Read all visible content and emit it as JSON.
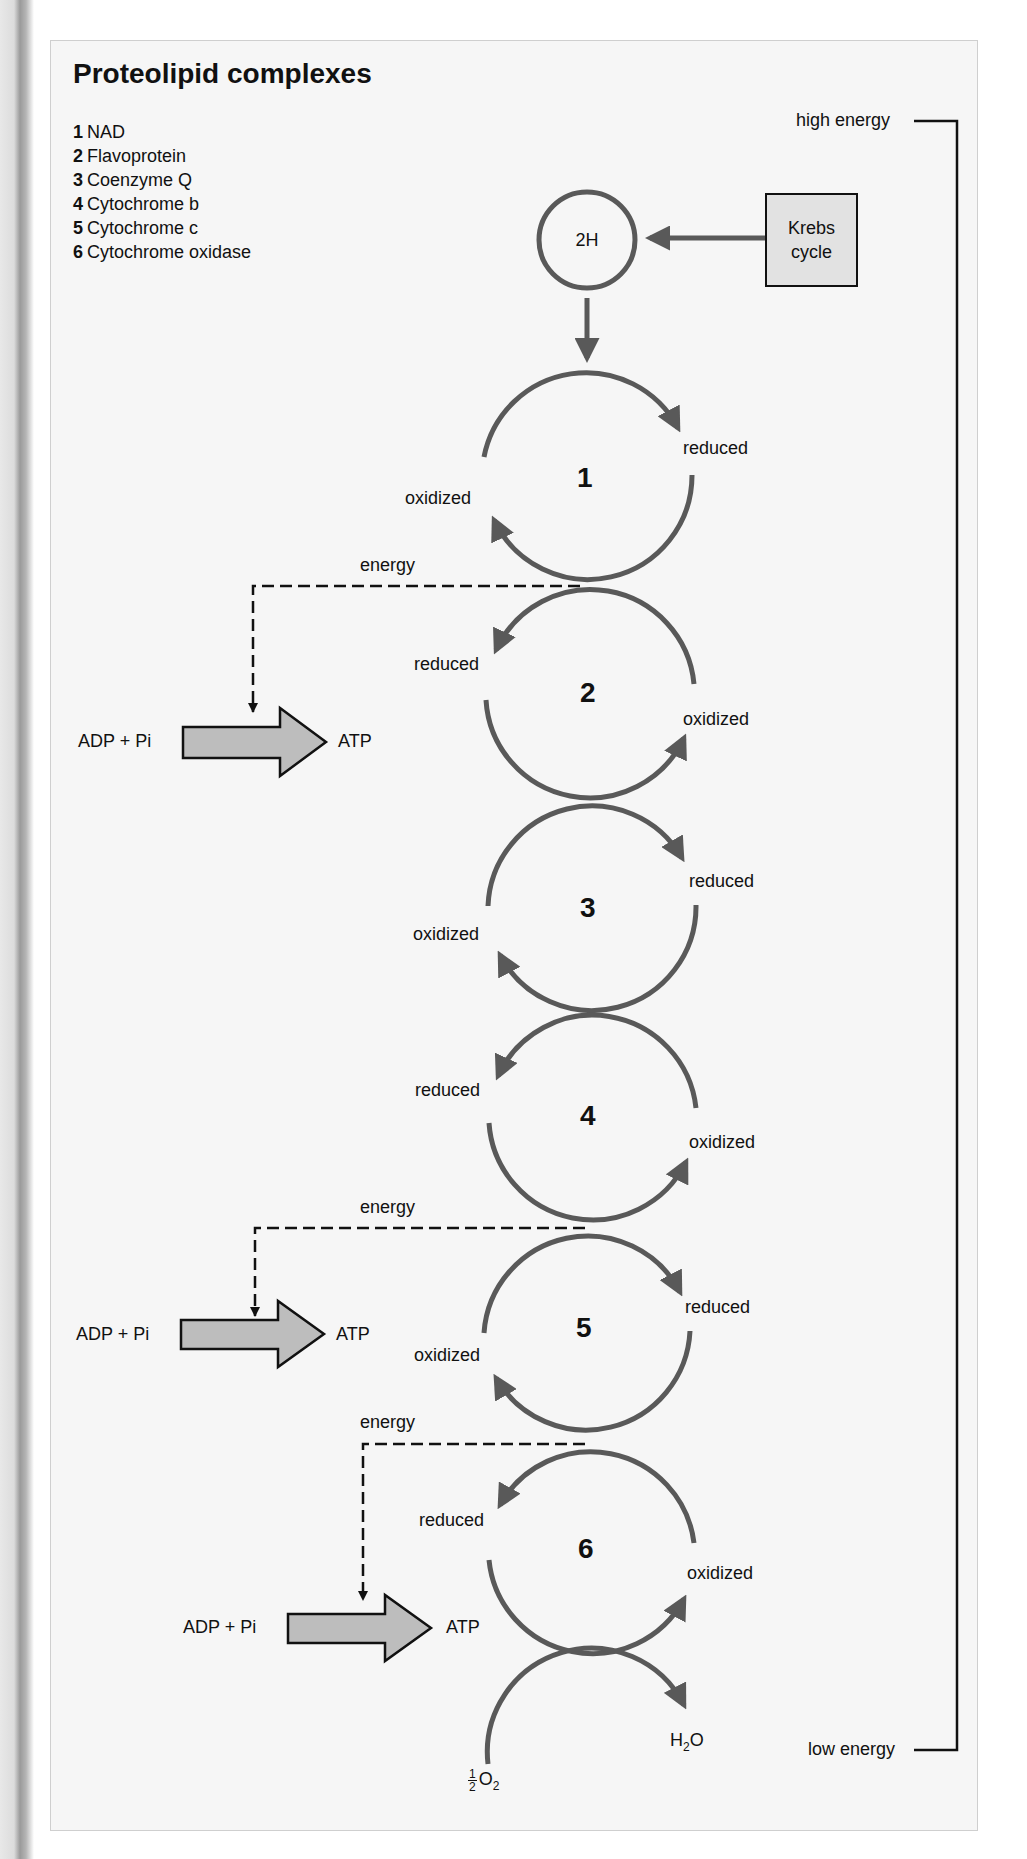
{
  "title": "Proteolipid complexes",
  "legend": [
    {
      "num": "1",
      "label": "NAD"
    },
    {
      "num": "2",
      "label": "Flavoprotein"
    },
    {
      "num": "3",
      "label": "Coenzyme Q"
    },
    {
      "num": "4",
      "label": "Cytochrome b"
    },
    {
      "num": "5",
      "label": "Cytochrome c"
    },
    {
      "num": "6",
      "label": "Cytochrome oxidase"
    }
  ],
  "source": {
    "krebs_line1": "Krebs",
    "krebs_line2": "cycle",
    "hydrogen": "2H"
  },
  "energy_scale": {
    "high": "high energy",
    "low": "low energy"
  },
  "complexes": [
    {
      "num": "1",
      "left_label": "oxidized",
      "right_label": "reduced"
    },
    {
      "num": "2",
      "left_label": "reduced",
      "right_label": "oxidized"
    },
    {
      "num": "3",
      "left_label": "oxidized",
      "right_label": "reduced"
    },
    {
      "num": "4",
      "left_label": "reduced",
      "right_label": "oxidized"
    },
    {
      "num": "5",
      "left_label": "oxidized",
      "right_label": "reduced"
    },
    {
      "num": "6",
      "left_label": "reduced",
      "right_label": "oxidized"
    }
  ],
  "phosphorylation": [
    {
      "energy": "energy",
      "reactant": "ADP + Pi",
      "product": "ATP"
    },
    {
      "energy": "energy",
      "reactant": "ADP + Pi",
      "product": "ATP"
    },
    {
      "energy": "energy",
      "reactant": "ADP + Pi",
      "product": "ATP"
    }
  ],
  "terminal": {
    "oxygen_frac_num": "1",
    "oxygen_frac_den": "2",
    "oxygen": "O",
    "oxygen_sub": "2",
    "water_h": "H",
    "water_sub": "2",
    "water_o": "O"
  },
  "colors": {
    "arrow": "#595959",
    "box_fill": "#e2e2e2",
    "panel": "#f6f6f6",
    "atp_arrow": "#bdbdbd"
  }
}
